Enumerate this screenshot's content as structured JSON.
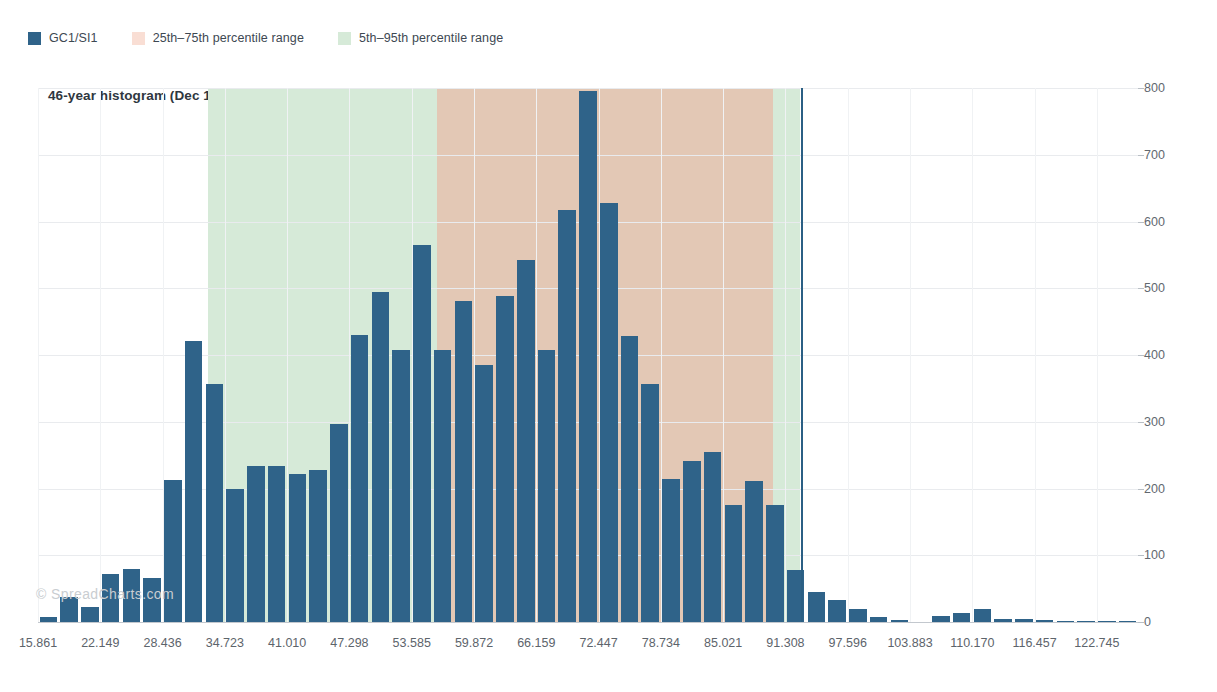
{
  "legend": {
    "items": [
      {
        "label": "GC1/SI1",
        "color": "#2f6389",
        "icon": "series-swatch"
      },
      {
        "label": "25th–75th percentile range",
        "color": "#f7d9ce",
        "icon": "band-swatch"
      },
      {
        "label": "5th–95th percentile range",
        "color": "#d6ead8",
        "icon": "band-swatch"
      }
    ]
  },
  "chart_title": "46-year histogram (Dec 11, 2020)",
  "watermark": "© SpreadCharts.com",
  "chart_data": {
    "type": "bar",
    "title": "46-year histogram (Dec 11, 2020)",
    "xlabel": "",
    "ylabel": "",
    "ylim": [
      0,
      800
    ],
    "ytick_values": [
      0,
      100,
      200,
      300,
      400,
      500,
      600,
      700,
      800
    ],
    "ytick_labels": [
      "0",
      "100",
      "200",
      "300",
      "400",
      "500",
      "600",
      "700",
      "800"
    ],
    "y_axis_position": "right",
    "grid": true,
    "legend_position": "top-left",
    "xtick_labels": [
      "15.861",
      "22.149",
      "28.436",
      "34.723",
      "41.010",
      "47.298",
      "53.585",
      "59.872",
      "66.159",
      "72.447",
      "78.734",
      "85.021",
      "91.308",
      "97.596",
      "103.883",
      "110.170",
      "116.457",
      "122.745"
    ],
    "xtick_values": [
      15.861,
      22.149,
      28.436,
      34.723,
      41.01,
      47.298,
      53.585,
      59.872,
      66.159,
      72.447,
      78.734,
      85.021,
      91.308,
      97.596,
      103.883,
      110.17,
      116.457,
      122.745
    ],
    "bin_width": 2.095,
    "x_start": 15.861,
    "series_name": "GC1/SI1",
    "series_color": "#2f6389",
    "values": [
      8,
      38,
      22,
      72,
      80,
      66,
      213,
      421,
      356,
      200,
      233,
      234,
      222,
      227,
      296,
      430,
      494,
      408,
      565,
      407,
      481,
      385,
      489,
      543,
      407,
      617,
      795,
      627,
      428,
      356,
      215,
      241,
      255,
      175,
      211,
      175,
      78,
      45,
      33,
      20,
      7,
      3,
      0,
      9,
      13,
      20,
      5,
      4,
      3,
      2,
      2,
      2,
      2
    ],
    "bands": [
      {
        "name": "5th–95th percentile range",
        "color": "#d6ead8",
        "x_start": 33.0,
        "x_end": 92.8
      },
      {
        "name": "25th–75th percentile range",
        "color": "#e3c8b5",
        "x_start": 56.1,
        "x_end": 90.1
      }
    ],
    "marker_line": {
      "name": "current-value-marker",
      "x": 92.9,
      "color": "#2b5f84"
    }
  }
}
